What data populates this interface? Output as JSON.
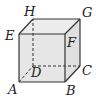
{
  "diagram": {
    "type": "cube",
    "colors": {
      "face_fill": "#e6e6e6",
      "top_fill": "#ececec",
      "side_fill": "#e2e2e2",
      "edge": "#333333",
      "label": "#222222"
    },
    "vertices": {
      "A": {
        "label": "A",
        "x": 19,
        "y": 82
      },
      "B": {
        "label": "B",
        "x": 65,
        "y": 82
      },
      "C": {
        "label": "C",
        "x": 80,
        "y": 66
      },
      "D": {
        "label": "D",
        "x": 33,
        "y": 66
      },
      "E": {
        "label": "E",
        "x": 19,
        "y": 34
      },
      "F": {
        "label": "F",
        "x": 65,
        "y": 34
      },
      "G": {
        "label": "G",
        "x": 80,
        "y": 19
      },
      "H": {
        "label": "H",
        "x": 33,
        "y": 19
      }
    },
    "hidden_edges": [
      "AD",
      "DC",
      "DH"
    ],
    "visible_edges": [
      "AB",
      "BC",
      "CG",
      "GH",
      "HE",
      "EA",
      "EF",
      "FG",
      "FB"
    ]
  }
}
